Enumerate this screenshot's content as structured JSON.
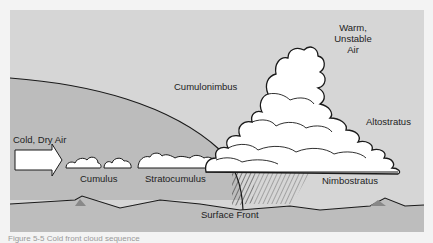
{
  "diagram": {
    "labels": {
      "warm_air": "Warm,\nUnstable\nAir",
      "warm_air_line1": "Warm,",
      "warm_air_line2": "Unstable",
      "warm_air_line3": "Air",
      "cold_air": "Cold, Dry Air",
      "cumulus": "Cumulus",
      "stratocumulus": "Stratocumulus",
      "cumulonimbus": "Cumulonimbus",
      "altostratus": "Altostratus",
      "nimbostratus": "Nimbostratus",
      "surface_front": "Surface Front"
    },
    "caption": "Figure 5-5  Cold front cloud sequence",
    "colors": {
      "sky_warm": "#d6d6d6",
      "cold_air_mass": "#b9b9b9",
      "ground": "#bdbdbd",
      "cloud": "#ffffff",
      "outline": "#1a1a1a"
    }
  }
}
